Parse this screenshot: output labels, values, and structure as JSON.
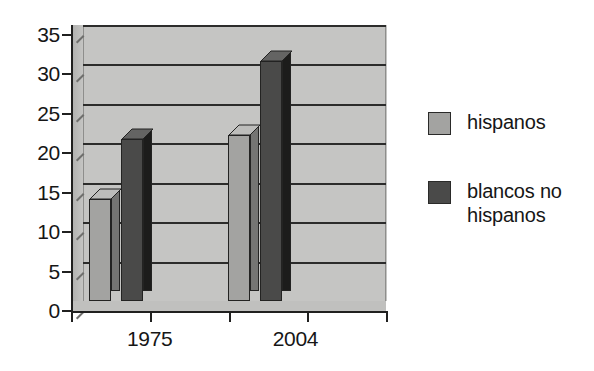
{
  "chart_data": {
    "type": "bar",
    "title": "",
    "subtitle": "",
    "xlabel": "",
    "ylabel": "",
    "categories": [
      "1975",
      "2004"
    ],
    "series": [
      {
        "name": "hispanos",
        "values": [
          13,
          21
        ],
        "color": "#a3a3a1"
      },
      {
        "name": "blancos no hispanos",
        "values": [
          20.5,
          30.5
        ],
        "color": "#4a4a49"
      }
    ],
    "ylim": [
      0,
      35
    ],
    "ytick_values": [
      0,
      5,
      10,
      15,
      20,
      25,
      30,
      35
    ],
    "ytick_labels": [
      "0",
      "5",
      "10",
      "15",
      "20",
      "25",
      "30",
      "35"
    ],
    "grid": true,
    "grid_axis": "y",
    "legend_position": "right",
    "style_3d": true,
    "plot_background": "#c5c5c3",
    "figure_background": "#ffffff"
  },
  "axes": {
    "y_ticks": [
      {
        "label": "35",
        "value": 35
      },
      {
        "label": "30",
        "value": 30
      },
      {
        "label": "25",
        "value": 25
      },
      {
        "label": "20",
        "value": 20
      },
      {
        "label": "15",
        "value": 15
      },
      {
        "label": "10",
        "value": 10
      },
      {
        "label": "5",
        "value": 5
      },
      {
        "label": "0",
        "value": 0
      }
    ],
    "x_categories": [
      {
        "label": "1975"
      },
      {
        "label": "2004"
      }
    ]
  },
  "legend": {
    "items": [
      {
        "label": "hispanos",
        "color": "#a3a3a1"
      },
      {
        "label": "blancos no hispanos",
        "color": "#4a4a49"
      }
    ]
  }
}
